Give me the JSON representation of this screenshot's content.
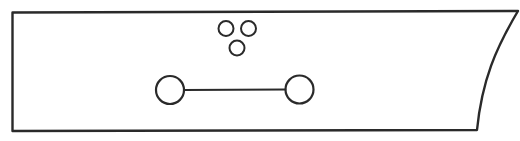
{
  "diagram": {
    "width": 520,
    "height": 141,
    "background": "#ffffff",
    "stroke_color": "#2a2a2a",
    "outline": {
      "name": "blade-outline",
      "stroke_width": 2.4,
      "path": "M 12.5 12.5 L 518 11 C 496 48 482 80 477 130 L 12.5 131 Z"
    },
    "small_holes": [
      {
        "name": "small-hole-top-left",
        "cx": 226,
        "cy": 28.5,
        "r": 7.5
      },
      {
        "name": "small-hole-top-right",
        "cx": 248.5,
        "cy": 28.5,
        "r": 7.5
      },
      {
        "name": "small-hole-bottom",
        "cx": 237,
        "cy": 48,
        "r": 7.5
      }
    ],
    "large_holes": [
      {
        "name": "large-hole-left",
        "cx": 170,
        "cy": 90,
        "r": 14
      },
      {
        "name": "large-hole-right",
        "cx": 299.5,
        "cy": 89.5,
        "r": 14
      }
    ],
    "connector": {
      "name": "hole-connector-line",
      "x1": 184,
      "y1": 90,
      "x2": 285.5,
      "y2": 89.5,
      "stroke_width": 1.8
    }
  }
}
